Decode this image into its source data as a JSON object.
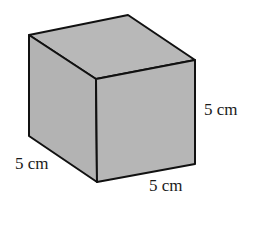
{
  "figure": {
    "shape": "cube",
    "fill_color": "#b5b5b5",
    "edge_color": "#111111",
    "labels": {
      "height": "5 cm",
      "depth": "5 cm",
      "width": "5 cm"
    }
  }
}
